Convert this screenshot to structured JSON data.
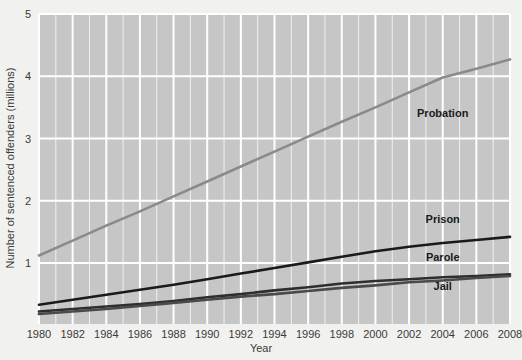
{
  "chart_data": {
    "type": "line",
    "title": "",
    "subtitle": "",
    "xlabel": "Year",
    "ylabel": "Number of sentenced offenders (millions)",
    "xlim": [
      1980,
      2008
    ],
    "ylim": [
      0,
      5
    ],
    "xticks": [
      1980,
      1982,
      1984,
      1986,
      1988,
      1990,
      1992,
      1994,
      1996,
      1998,
      2000,
      2002,
      2004,
      2006,
      2008
    ],
    "xtick_labels": [
      "1980",
      "1982",
      "1984",
      "1986",
      "1988",
      "1990",
      "1992",
      "1994",
      "1996",
      "1998",
      "2000",
      "2002",
      "2004",
      "2006",
      "2008"
    ],
    "yticks": [
      1,
      2,
      3,
      4,
      5
    ],
    "ytick_labels": [
      "1",
      "2",
      "3",
      "4",
      "5"
    ],
    "grid": true,
    "grid_color": "#ffffff",
    "plot_background": "#c6c6c6",
    "figure_background": "#f1f1ef",
    "legend_position": "inline-labels",
    "x": [
      1980,
      1982,
      1984,
      1986,
      1988,
      1990,
      1992,
      1994,
      1996,
      1998,
      2000,
      2002,
      2004,
      2006,
      2008
    ],
    "series": [
      {
        "name": "Probation",
        "color": "#8a8a8a",
        "label_x": 2004,
        "label_y": 3.35,
        "values": [
          1.12,
          1.36,
          1.6,
          1.83,
          2.07,
          2.31,
          2.55,
          2.79,
          3.03,
          3.27,
          3.5,
          3.74,
          3.98,
          4.12,
          4.27
        ]
      },
      {
        "name": "Prison",
        "color": "#1a1a1a",
        "label_x": 2004,
        "label_y": 1.64,
        "values": [
          0.33,
          0.41,
          0.49,
          0.57,
          0.65,
          0.74,
          0.83,
          0.92,
          1.01,
          1.1,
          1.19,
          1.26,
          1.32,
          1.37,
          1.42
        ]
      },
      {
        "name": "Parole",
        "color": "#2e2e2e",
        "label_x": 2004,
        "label_y": 1.03,
        "values": [
          0.22,
          0.26,
          0.3,
          0.34,
          0.39,
          0.45,
          0.5,
          0.56,
          0.61,
          0.67,
          0.71,
          0.74,
          0.77,
          0.79,
          0.82
        ]
      },
      {
        "name": "Jail",
        "color": "#4a4a4a",
        "label_x": 2004,
        "label_y": 0.56,
        "values": [
          0.18,
          0.22,
          0.26,
          0.31,
          0.36,
          0.41,
          0.46,
          0.5,
          0.55,
          0.6,
          0.64,
          0.69,
          0.72,
          0.76,
          0.79
        ]
      }
    ]
  }
}
